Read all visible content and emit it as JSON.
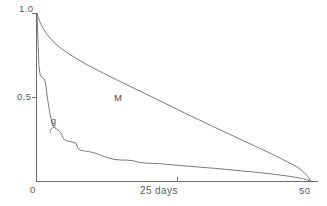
{
  "chart_data": {
    "type": "line",
    "title": "",
    "subtitle": "",
    "xlabel": "25 days",
    "ylabel": "",
    "xlim": [
      0,
      50
    ],
    "ylim": [
      0,
      1.0
    ],
    "grid": false,
    "legend": "inline-curve-labels",
    "x_ticks": [
      {
        "value": 0,
        "label": "0"
      },
      {
        "value": 25,
        "label": "25 days"
      },
      {
        "value": 50,
        "label": "50"
      }
    ],
    "y_ticks": [
      {
        "value": 0.5,
        "label": "0.5"
      },
      {
        "value": 1.0,
        "label": "1.0"
      }
    ],
    "annotations": [
      {
        "text": "M",
        "x": 21.5,
        "y": 0.52,
        "describes": "upper-decay-curve"
      },
      {
        "text": "g",
        "x": 4.0,
        "y": 0.36,
        "describes": "lower-decay-curve"
      }
    ],
    "series": [
      {
        "name": "M",
        "label": "M",
        "color": "#6b6b6b",
        "style": "smooth-convex-decay",
        "points": [
          {
            "x": 0.0,
            "y": 1.0
          },
          {
            "x": 0.6,
            "y": 0.945
          },
          {
            "x": 1.3,
            "y": 0.902
          },
          {
            "x": 2.2,
            "y": 0.86
          },
          {
            "x": 3.3,
            "y": 0.822
          },
          {
            "x": 4.6,
            "y": 0.787
          },
          {
            "x": 6.2,
            "y": 0.752
          },
          {
            "x": 8.0,
            "y": 0.716
          },
          {
            "x": 10.0,
            "y": 0.68
          },
          {
            "x": 12.2,
            "y": 0.643
          },
          {
            "x": 14.5,
            "y": 0.606
          },
          {
            "x": 17.0,
            "y": 0.566
          },
          {
            "x": 19.5,
            "y": 0.527
          },
          {
            "x": 22.0,
            "y": 0.487
          },
          {
            "x": 24.5,
            "y": 0.447
          },
          {
            "x": 27.0,
            "y": 0.407
          },
          {
            "x": 29.5,
            "y": 0.368
          },
          {
            "x": 32.0,
            "y": 0.329
          },
          {
            "x": 34.5,
            "y": 0.291
          },
          {
            "x": 37.0,
            "y": 0.253
          },
          {
            "x": 39.5,
            "y": 0.215
          },
          {
            "x": 42.0,
            "y": 0.177
          },
          {
            "x": 44.0,
            "y": 0.145
          },
          {
            "x": 46.0,
            "y": 0.112
          },
          {
            "x": 47.5,
            "y": 0.085
          },
          {
            "x": 48.8,
            "y": 0.052
          },
          {
            "x": 49.6,
            "y": 0.022
          },
          {
            "x": 50.0,
            "y": 0.0
          }
        ]
      },
      {
        "name": "g",
        "label": "g",
        "color": "#6b6b6b",
        "style": "steep-stepped-decay",
        "points": [
          {
            "x": 0.0,
            "y": 1.0
          },
          {
            "x": 0.2,
            "y": 0.82
          },
          {
            "x": 0.35,
            "y": 0.69
          },
          {
            "x": 0.55,
            "y": 0.64
          },
          {
            "x": 0.75,
            "y": 0.625
          },
          {
            "x": 1.0,
            "y": 0.618
          },
          {
            "x": 1.3,
            "y": 0.61
          },
          {
            "x": 1.55,
            "y": 0.59
          },
          {
            "x": 1.8,
            "y": 0.52
          },
          {
            "x": 2.1,
            "y": 0.455
          },
          {
            "x": 2.4,
            "y": 0.4
          },
          {
            "x": 2.7,
            "y": 0.355
          },
          {
            "x": 3.0,
            "y": 0.33
          },
          {
            "x": 3.3,
            "y": 0.318
          },
          {
            "x": 3.7,
            "y": 0.31
          },
          {
            "x": 4.1,
            "y": 0.3
          },
          {
            "x": 4.4,
            "y": 0.288
          },
          {
            "x": 4.7,
            "y": 0.262
          },
          {
            "x": 5.0,
            "y": 0.248
          },
          {
            "x": 5.4,
            "y": 0.243
          },
          {
            "x": 6.0,
            "y": 0.238
          },
          {
            "x": 6.6,
            "y": 0.234
          },
          {
            "x": 7.1,
            "y": 0.228
          },
          {
            "x": 7.5,
            "y": 0.196
          },
          {
            "x": 8.0,
            "y": 0.186
          },
          {
            "x": 8.8,
            "y": 0.181
          },
          {
            "x": 9.6,
            "y": 0.177
          },
          {
            "x": 10.5,
            "y": 0.17
          },
          {
            "x": 11.4,
            "y": 0.16
          },
          {
            "x": 12.3,
            "y": 0.148
          },
          {
            "x": 13.2,
            "y": 0.138
          },
          {
            "x": 14.2,
            "y": 0.131
          },
          {
            "x": 15.3,
            "y": 0.128
          },
          {
            "x": 16.5,
            "y": 0.127
          },
          {
            "x": 17.6,
            "y": 0.123
          },
          {
            "x": 18.7,
            "y": 0.114
          },
          {
            "x": 19.8,
            "y": 0.11
          },
          {
            "x": 21.0,
            "y": 0.108
          },
          {
            "x": 22.4,
            "y": 0.106
          },
          {
            "x": 23.8,
            "y": 0.102
          },
          {
            "x": 25.2,
            "y": 0.098
          },
          {
            "x": 26.6,
            "y": 0.094
          },
          {
            "x": 28.0,
            "y": 0.09
          },
          {
            "x": 29.5,
            "y": 0.086
          },
          {
            "x": 31.0,
            "y": 0.082
          },
          {
            "x": 32.6,
            "y": 0.078
          },
          {
            "x": 34.2,
            "y": 0.073
          },
          {
            "x": 35.8,
            "y": 0.068
          },
          {
            "x": 37.4,
            "y": 0.063
          },
          {
            "x": 39.0,
            "y": 0.058
          },
          {
            "x": 40.6,
            "y": 0.053
          },
          {
            "x": 42.2,
            "y": 0.047
          },
          {
            "x": 43.8,
            "y": 0.041
          },
          {
            "x": 45.4,
            "y": 0.034
          },
          {
            "x": 47.0,
            "y": 0.026
          },
          {
            "x": 48.4,
            "y": 0.018
          },
          {
            "x": 49.4,
            "y": 0.009
          },
          {
            "x": 50.0,
            "y": 0.0
          }
        ]
      }
    ]
  },
  "axes": {
    "y_top_label": "1.0",
    "y_mid_label": "0.5",
    "x_zero_label": "0",
    "x_mid_label": "25 days",
    "x_max_label": "50"
  },
  "labels": {
    "curve_m": "M",
    "curve_g": "g"
  },
  "colors": {
    "ink": "#5a5a5a",
    "curve": "#6b6b6b",
    "background": "#ffffff"
  }
}
